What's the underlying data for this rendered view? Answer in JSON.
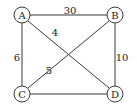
{
  "graph": {
    "nodes": [
      {
        "id": "A",
        "label": "A",
        "x": 22,
        "y": 15
      },
      {
        "id": "B",
        "label": "B",
        "x": 115,
        "y": 15
      },
      {
        "id": "C",
        "label": "C",
        "x": 22,
        "y": 94
      },
      {
        "id": "D",
        "label": "D",
        "x": 115,
        "y": 94
      }
    ],
    "edges": [
      {
        "from": "A",
        "to": "B",
        "weight": "30",
        "label_x": 70,
        "label_y": 10
      },
      {
        "from": "A",
        "to": "D",
        "weight": "4",
        "label_x": 55,
        "label_y": 32
      },
      {
        "from": "A",
        "to": "C",
        "weight": "6",
        "label_x": 19,
        "label_y": 57
      },
      {
        "from": "C",
        "to": "B",
        "weight": "5",
        "label_x": 49,
        "label_y": 70
      },
      {
        "from": "B",
        "to": "D",
        "weight": "10",
        "label_x": 121,
        "label_y": 57
      },
      {
        "from": "C",
        "to": "D",
        "weight": "",
        "label_x": 68,
        "label_y": 94
      }
    ],
    "node_radius": 8,
    "stroke_color": "#3a3a3a"
  }
}
